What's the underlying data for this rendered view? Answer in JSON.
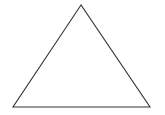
{
  "diagram": {
    "shape": "triangle",
    "type": "isosceles-triangle-outline",
    "stroke_color": "#333333",
    "fill_color": "#ffffff",
    "background": "#ffffff",
    "vertices": {
      "apex": [
        81,
        5
      ],
      "bottom_left": [
        13,
        107
      ],
      "bottom_right": [
        150,
        107
      ]
    }
  }
}
